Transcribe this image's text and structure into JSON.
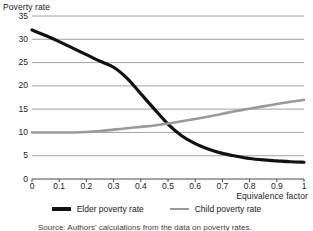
{
  "figure": {
    "source_note": "Source: Authors' calculations from the data on poverty rates."
  },
  "legend": {
    "position": "bottom-center",
    "items": [
      {
        "label": "Elder poverty rate",
        "color": "#111111",
        "name": "elder-poverty-rate"
      },
      {
        "label": "Child poverty rate",
        "color": "#9a9a9a",
        "name": "child-poverty-rate"
      }
    ]
  },
  "chart_data": {
    "type": "line",
    "title": "",
    "xlabel": "Equivalence factor",
    "ylabel": "Poverty rate",
    "xlim": [
      0,
      1
    ],
    "ylim": [
      0,
      35
    ],
    "grid": "horizontal",
    "legend_position": "bottom-center",
    "xticks": [
      "0",
      "0.1",
      "0.2",
      "0.3",
      "0.4",
      "0.5",
      "0.6",
      "0.7",
      "0.8",
      "0.9",
      "1"
    ],
    "xtick_values": [
      0,
      0.1,
      0.2,
      0.3,
      0.4,
      0.5,
      0.6,
      0.7,
      0.8,
      0.9,
      1
    ],
    "yticks": [
      "0",
      "5",
      "10",
      "15",
      "20",
      "25",
      "30",
      "35"
    ],
    "ytick_values": [
      0,
      5,
      10,
      15,
      20,
      25,
      30,
      35
    ],
    "x": [
      0,
      0.05,
      0.1,
      0.15,
      0.2,
      0.25,
      0.3,
      0.35,
      0.4,
      0.45,
      0.5,
      0.55,
      0.6,
      0.65,
      0.7,
      0.75,
      0.8,
      0.85,
      0.9,
      0.95,
      1
    ],
    "series": [
      {
        "name": "Elder poverty rate",
        "color": "#111111",
        "width": 3.2,
        "values": [
          32.0,
          30.8,
          29.5,
          28.1,
          26.7,
          25.3,
          24.0,
          21.6,
          18.3,
          15.0,
          11.8,
          9.3,
          7.6,
          6.4,
          5.5,
          4.9,
          4.4,
          4.1,
          3.9,
          3.7,
          3.6
        ]
      },
      {
        "name": "Child poverty rate",
        "color": "#9a9a9a",
        "width": 2.6,
        "values": [
          10.0,
          10.0,
          10.0,
          10.0,
          10.1,
          10.3,
          10.6,
          10.9,
          11.2,
          11.5,
          11.9,
          12.4,
          12.9,
          13.4,
          14.0,
          14.6,
          15.1,
          15.6,
          16.1,
          16.6,
          17.0
        ]
      }
    ]
  }
}
